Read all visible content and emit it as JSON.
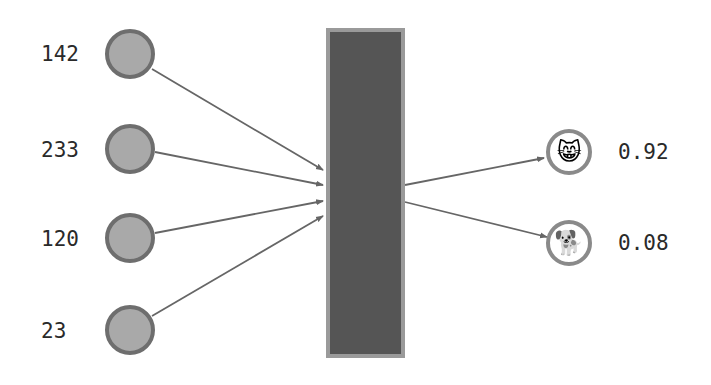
{
  "diagram": {
    "title": "",
    "colors": {
      "input_fill": "#a9a9a9",
      "input_stroke": "#6e6e6e",
      "model_fill": "#555555",
      "model_stroke": "#9a9a9a",
      "arrow": "#666666",
      "output_fill": "#ffffff",
      "output_stroke": "#8a8a8a",
      "text": "#2a2a2a"
    },
    "inputs": [
      {
        "value": "142",
        "cx": 130,
        "cy": 54
      },
      {
        "value": "233",
        "cx": 130,
        "cy": 149
      },
      {
        "value": "120",
        "cx": 130,
        "cy": 238
      },
      {
        "value": "23",
        "cx": 130,
        "cy": 330
      }
    ],
    "model_block": {
      "x": 326,
      "y": 28,
      "width": 79,
      "height": 330
    },
    "outputs": [
      {
        "class_icon": "grinning-cat-icon",
        "glyph": "😸",
        "probability": "0.92",
        "cx": 569,
        "cy": 152
      },
      {
        "class_icon": "dog-icon",
        "glyph": "🐕",
        "probability": "0.08",
        "cx": 569,
        "cy": 243
      }
    ]
  }
}
